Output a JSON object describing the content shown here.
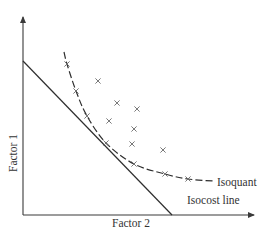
{
  "diagram": {
    "labels": {
      "y_axis": "Factor 1",
      "x_axis": "Factor 2",
      "isoquant": "Isoquant",
      "isocost": "Isocost line"
    },
    "colors": {
      "line": "#2e2e2e",
      "axis": "#3a3a3a",
      "marker": "#6a6a6a",
      "text": "#333333",
      "background": "#ffffff"
    },
    "axes": {
      "origin": [
        23,
        215
      ],
      "y_top": [
        23,
        13
      ],
      "x_end": [
        258,
        215
      ]
    },
    "isocost_line": {
      "from": [
        23,
        61
      ],
      "to": [
        172,
        215
      ]
    },
    "isoquant_curve": {
      "style": "dashed",
      "points": [
        [
          64,
          52
        ],
        [
          67,
          64
        ],
        [
          76,
          91
        ],
        [
          87,
          116
        ],
        [
          106,
          143
        ],
        [
          134,
          164
        ],
        [
          165,
          174
        ],
        [
          188,
          179
        ],
        [
          213,
          181
        ]
      ]
    },
    "tangency_point": [
      106,
      143
    ],
    "markers": [
      [
        67,
        64
      ],
      [
        98,
        81
      ],
      [
        76,
        91
      ],
      [
        117,
        103
      ],
      [
        137,
        109
      ],
      [
        87,
        116
      ],
      [
        109,
        121
      ],
      [
        134,
        129
      ],
      [
        106,
        143
      ],
      [
        132,
        144
      ],
      [
        163,
        150
      ],
      [
        134,
        164
      ],
      [
        165,
        174
      ],
      [
        188,
        179
      ]
    ]
  }
}
